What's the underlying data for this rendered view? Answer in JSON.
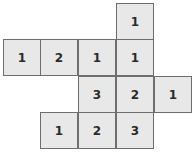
{
  "diagram": {
    "type": "cube-net-grid",
    "cell_color": "#e8e8e8",
    "border_color": "#6e6e6e",
    "cells": [
      {
        "row": 0,
        "col": 3,
        "value": "1"
      },
      {
        "row": 1,
        "col": 0,
        "value": "1"
      },
      {
        "row": 1,
        "col": 1,
        "value": "2"
      },
      {
        "row": 1,
        "col": 2,
        "value": "1"
      },
      {
        "row": 1,
        "col": 3,
        "value": "1"
      },
      {
        "row": 2,
        "col": 2,
        "value": "3"
      },
      {
        "row": 2,
        "col": 3,
        "value": "2"
      },
      {
        "row": 2,
        "col": 4,
        "value": "1"
      },
      {
        "row": 3,
        "col": 1,
        "value": "1"
      },
      {
        "row": 3,
        "col": 2,
        "value": "2"
      },
      {
        "row": 3,
        "col": 3,
        "value": "3"
      }
    ]
  }
}
